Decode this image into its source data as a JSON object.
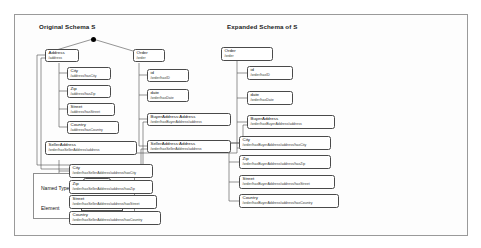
{
  "figure": {
    "left_panel_title": "Original Schema S",
    "right_panel_title": "Expanded Schema of S"
  },
  "original_schema": {
    "root_marker": "root-dot",
    "nodes": [
      {
        "name": "Address",
        "path": "/address"
      },
      {
        "name": "City",
        "path": "/address/hasCity"
      },
      {
        "name": "Zip",
        "path": "/address/hasZip"
      },
      {
        "name": "Street",
        "path": "/address/hasStreet"
      },
      {
        "name": "Country",
        "path": "/address/hasCountry"
      },
      {
        "name": "Order",
        "path": "/order"
      },
      {
        "name": "id",
        "path": "/order/hasID"
      },
      {
        "name": "date",
        "path": "/order/hasDate"
      },
      {
        "name": "BuyerAddress:Address",
        "path": "/order/hasBuyerAddress/address"
      },
      {
        "name": "SellerAddress:Address",
        "path": "/order/hasSellerAddress/address"
      }
    ]
  },
  "expanded_schema": {
    "nodes": [
      {
        "name": "Order",
        "path": "/order"
      },
      {
        "name": "id",
        "path": "/order/hasID"
      },
      {
        "name": "date",
        "path": "/order/hasDate"
      },
      {
        "name": "BuyerAddress",
        "path": "/order/hasBuyerAddress/address"
      },
      {
        "name": "SellerAddress",
        "path": "/order/hasSellerAddress/address"
      },
      {
        "name": "City",
        "path": "/order/hasSellerAddress/address/hasCity"
      },
      {
        "name": "Zip",
        "path": "/order/hasSellerAddress/address/hasZip"
      },
      {
        "name": "Street",
        "path": "/order/hasSellerAddress/address/hasStreet"
      },
      {
        "name": "Country",
        "path": "/order/hasSellerAddress/address/hasCountry"
      },
      {
        "name": "City",
        "path": "/order/hasBuyerAddress/address/hasCity"
      },
      {
        "name": "Zip",
        "path": "/order/hasBuyerAddress/address/hasZip"
      },
      {
        "name": "Street",
        "path": "/order/hasBuyerAddress/address/hasStreet"
      },
      {
        "name": "Country",
        "path": "/order/hasBuyerAddress/address/hasCountry"
      }
    ]
  },
  "legend": {
    "rows": [
      {
        "label": "Named Type"
      },
      {
        "label": "Element"
      }
    ]
  }
}
